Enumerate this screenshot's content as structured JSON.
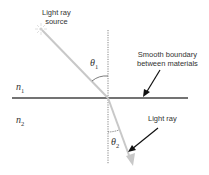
{
  "labels": {
    "source_line1": "Light ray",
    "source_line2": "source",
    "boundary_line1": "Smooth boundary",
    "boundary_line2": "between materials",
    "ray": "Light ray"
  },
  "symbols": {
    "theta1": "θ",
    "theta1_sub": "1",
    "theta2": "θ",
    "theta2_sub": "2",
    "n1": "n",
    "n1_sub": "1",
    "n2": "n",
    "n2_sub": "2"
  },
  "colors": {
    "ray": "#c8c8c8",
    "boundary": "#444444",
    "normal": "#555555",
    "arrow": "#111111"
  }
}
